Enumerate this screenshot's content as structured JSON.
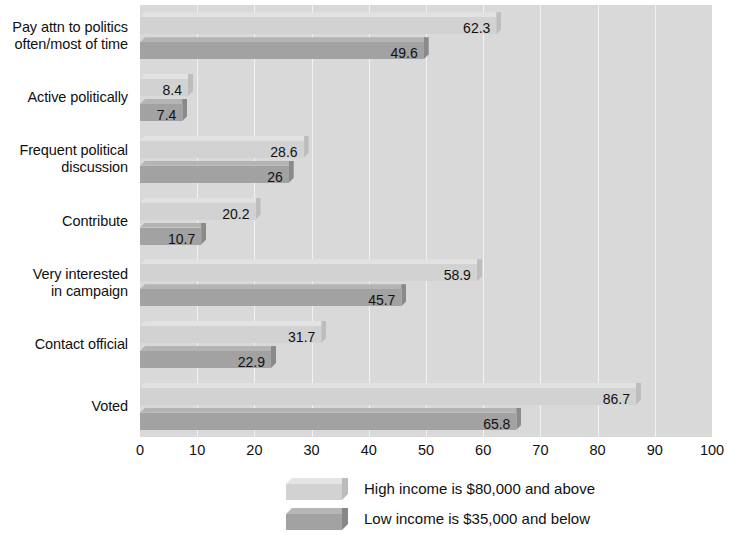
{
  "chart_data": {
    "type": "bar",
    "orientation": "horizontal",
    "title": "",
    "xlabel": "",
    "ylabel": "",
    "xlim": [
      0,
      100
    ],
    "xticks": [
      0,
      10,
      20,
      30,
      40,
      50,
      60,
      70,
      80,
      90,
      100
    ],
    "grid": true,
    "legend_position": "bottom",
    "categories": [
      "Pay attn to politics\noften/most of time",
      "Active politically",
      "Frequent political\ndiscussion",
      "Contribute",
      "Very interested\nin campaign",
      "Contact official",
      "Voted"
    ],
    "series": [
      {
        "name": "High income is $80,000 and above",
        "color": "#d2d2d2",
        "values": [
          62.3,
          8.4,
          28.6,
          20.2,
          58.9,
          31.7,
          86.7
        ],
        "labels": [
          "62.3",
          "8.4",
          "28.6",
          "20.2",
          "58.9",
          "31.7",
          "86.7"
        ]
      },
      {
        "name": "Low income is $35,000 and below",
        "color": "#a2a2a2",
        "values": [
          49.6,
          7.4,
          26,
          10.7,
          45.7,
          22.9,
          65.8
        ],
        "labels": [
          "49.6",
          "7.4",
          "26",
          "10.7",
          "45.7",
          "22.9",
          "65.8"
        ]
      }
    ]
  },
  "legend": {
    "items": [
      {
        "label": "High income is $80,000 and above"
      },
      {
        "label": "Low income is $35,000 and below"
      }
    ]
  }
}
